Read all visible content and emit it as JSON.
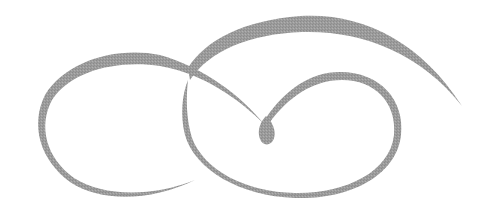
{
  "image": {
    "description": "Decorative calligraphic flourish ornament with interlocking swirls and a central teardrop",
    "width": 492,
    "height": 215,
    "background_color": "#ffffff",
    "ink_color": "#9a9a9a"
  },
  "elements": [
    {
      "name": "left-loop",
      "description": "Left oval swirl with thick upper stroke tapering into a thin lower tail"
    },
    {
      "name": "top-arc",
      "description": "Large sweeping arc across the top ending in a tapered point on the right"
    },
    {
      "name": "right-loop",
      "description": "Right oval loop descending from the central teardrop"
    },
    {
      "name": "teardrop",
      "description": "Central teardrop-shaped drop where the strokes meet"
    }
  ]
}
